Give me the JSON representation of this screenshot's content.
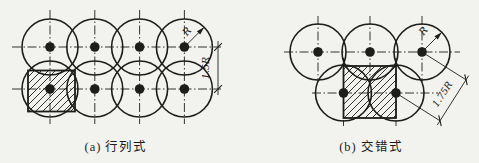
{
  "page": {
    "background": "#f2f2ee",
    "ink": "#1d1d1b"
  },
  "panels": [
    {
      "caption": "(a) 行列式",
      "caption_x": 116,
      "caption_y": 136,
      "radius": 28,
      "dot_radius": 4.8,
      "circles": [
        [
          50,
          47
        ],
        [
          94.8,
          47
        ],
        [
          139.6,
          47
        ],
        [
          184.4,
          47
        ],
        [
          50,
          89
        ],
        [
          94.8,
          89
        ],
        [
          139.6,
          89
        ],
        [
          184.4,
          89
        ]
      ],
      "centerlines": [
        [
          12,
          47,
          221,
          47
        ],
        [
          12,
          89,
          221,
          89
        ],
        [
          50,
          10,
          50,
          124
        ],
        [
          94.8,
          10,
          94.8,
          124
        ],
        [
          139.6,
          10,
          139.6,
          124
        ],
        [
          184.4,
          10,
          184.4,
          124
        ]
      ],
      "hatch": {
        "x": 28,
        "y": 70.5,
        "w": 47,
        "h": 41
      },
      "arrows": [
        [
          184.4,
          47,
          204.2,
          27.2
        ]
      ],
      "lines": [
        [
          218,
          41,
          218,
          95
        ]
      ],
      "ticks": [
        {
          "x": 218,
          "y": 47,
          "angle": -45
        },
        {
          "x": 218,
          "y": 89,
          "angle": -45
        }
      ],
      "labels": [
        {
          "text": "R",
          "x": 189.5,
          "y": 33.5,
          "rot": -50,
          "size": 10
        },
        {
          "text": "1.5R",
          "x": 208.5,
          "y": 68,
          "rot": -90,
          "size": 9.5
        }
      ]
    },
    {
      "caption": "(b) 交错式",
      "caption_x": 371,
      "caption_y": 136,
      "radius": 28,
      "dot_radius": 4.8,
      "circles": [
        [
          318,
          52
        ],
        [
          370,
          52
        ],
        [
          422,
          52
        ],
        [
          343.5,
          93
        ],
        [
          396,
          93
        ]
      ],
      "centerlines": [
        [
          284,
          52,
          460,
          52
        ],
        [
          312,
          93,
          438,
          93
        ],
        [
          318,
          16,
          318,
          82
        ],
        [
          370,
          16,
          370,
          82
        ],
        [
          422,
          16,
          422,
          82
        ],
        [
          343.5,
          58,
          343.5,
          126
        ],
        [
          396,
          58,
          396,
          126
        ]
      ],
      "hatch": {
        "x": 343.5,
        "y": 66,
        "w": 52.5,
        "h": 52
      },
      "arrows": [
        [
          422,
          52,
          441.8,
          32.2
        ]
      ],
      "lines": [
        [
          422,
          52,
          466,
          79.8
        ],
        [
          396,
          93,
          440,
          120.8
        ],
        [
          437.3,
          125,
          468.7,
          75.6
        ]
      ],
      "ticks": [
        {
          "x": 440,
          "y": 120.8,
          "angle": -103
        },
        {
          "x": 466,
          "y": 79.8,
          "angle": -103
        }
      ],
      "labels": [
        {
          "text": "R",
          "x": 426,
          "y": 33,
          "rot": -50,
          "size": 10
        },
        {
          "text": "1.75R",
          "x": 445,
          "y": 96,
          "rot": -57,
          "size": 9.5
        }
      ]
    }
  ]
}
